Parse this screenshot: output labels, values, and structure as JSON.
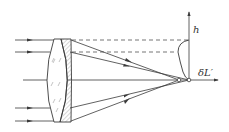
{
  "diagram": {
    "labels": {
      "h_axis": "h",
      "longitudinal_aberration": "δL′"
    },
    "colors": {
      "line": "#3a3a3a",
      "background": "#ffffff"
    },
    "incident_rays_y": [
      40,
      52,
      108,
      121
    ],
    "focus_points": [
      {
        "name": "marginal-focus",
        "x": 179,
        "y": 80
      },
      {
        "name": "paraxial-focus",
        "x": 189,
        "y": 80
      }
    ]
  }
}
